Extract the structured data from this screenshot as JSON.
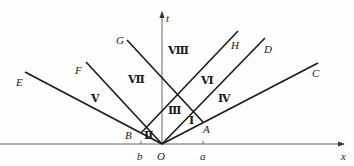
{
  "diagram": {
    "axes": {
      "x_label": "x",
      "t_label": "t",
      "origin_label": "O",
      "ticks": [
        {
          "label": "b",
          "x": 141
        },
        {
          "label": "a",
          "x": 203
        }
      ]
    },
    "points": {
      "A": "A",
      "B": "B",
      "C": "C",
      "D": "D",
      "E": "E",
      "F": "F",
      "G": "G",
      "H": "H"
    },
    "regions": {
      "I": "Ⅰ",
      "II": "Ⅱ",
      "III": "Ⅲ",
      "IV": "Ⅳ",
      "V": "Ⅴ",
      "VI": "Ⅵ",
      "VII": "Ⅶ",
      "VIII": "Ⅷ"
    },
    "line_color": "#1a1a1a",
    "background": "#fefefe"
  }
}
